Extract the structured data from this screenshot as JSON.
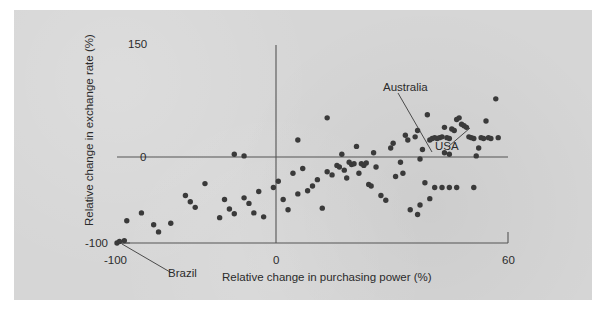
{
  "figure": {
    "background_color": "#d6d6d6",
    "page_color": "#ffffff",
    "point_color": "#3a3a3a",
    "axis_color": "#555555",
    "text_color": "#2b2b2b"
  },
  "axes": {
    "x_title": "Relative change in purchasing power (%)",
    "y_title": "Relative change in exchange rate (%)",
    "x_ticks": [
      "-100",
      "0",
      "60"
    ],
    "y_ticks": [
      "150",
      "0",
      "-100"
    ]
  },
  "annotations": [
    {
      "name": "Australia",
      "label": "Australia"
    },
    {
      "name": "USA",
      "label": "USA"
    },
    {
      "name": "Brazil",
      "label": "Brazil"
    }
  ],
  "chart_data": {
    "type": "scatter",
    "title": "",
    "xlabel": "Relative change in purchasing power (%)",
    "ylabel": "Relative change in exchange rate (%)",
    "xlim": [
      -100,
      60
    ],
    "ylim": [
      -100,
      150
    ],
    "xticks": [
      -100,
      0,
      60
    ],
    "yticks": [
      -100,
      0,
      150
    ],
    "grid": false,
    "legend": null,
    "zero_lines": {
      "x": 0,
      "y": 0
    },
    "annotations": [
      {
        "label": "Australia",
        "text_x": -8,
        "text_y": 100,
        "point_x": 16,
        "point_y": 2
      },
      {
        "label": "USA",
        "text_x": 26,
        "text_y": 14,
        "point_x": 35,
        "point_y": 33
      },
      {
        "label": "Brazil",
        "text_x": -80,
        "text_y": -135,
        "point_x": -100,
        "point_y": -100
      }
    ],
    "series": [
      {
        "name": "countries",
        "points": [
          [
            -100,
            -100
          ],
          [
            -99,
            -98
          ],
          [
            -97,
            -97
          ],
          [
            -96,
            -72
          ],
          [
            -90,
            -62
          ],
          [
            -85,
            -77
          ],
          [
            -83,
            -86
          ],
          [
            -78,
            -75
          ],
          [
            -72,
            -40
          ],
          [
            -70,
            -48
          ],
          [
            -68,
            -55
          ],
          [
            -64,
            -25
          ],
          [
            -58,
            -68
          ],
          [
            -56,
            -45
          ],
          [
            -54,
            -57
          ],
          [
            -52,
            -63
          ],
          [
            -48,
            -43
          ],
          [
            -46,
            -50
          ],
          [
            -44,
            -62
          ],
          [
            -42,
            -35
          ],
          [
            -40,
            -67
          ],
          [
            -36,
            -30
          ],
          [
            -34,
            -22
          ],
          [
            -32,
            -45
          ],
          [
            -30,
            -58
          ],
          [
            -28,
            -12
          ],
          [
            -26,
            -38
          ],
          [
            -24,
            -6
          ],
          [
            -22,
            -34
          ],
          [
            -20,
            -28
          ],
          [
            -18,
            -20
          ],
          [
            -16,
            -56
          ],
          [
            -14,
            -10
          ],
          [
            -12,
            -14
          ],
          [
            -10,
            -2
          ],
          [
            -9,
            -4
          ],
          [
            -8,
            12
          ],
          [
            -7,
            -8
          ],
          [
            -6,
            -18
          ],
          [
            -5,
            2
          ],
          [
            -4,
            -1
          ],
          [
            -3,
            0
          ],
          [
            -2,
            22
          ],
          [
            -1,
            -12
          ],
          [
            -14,
            58
          ],
          [
            -26,
            30
          ],
          [
            -48,
            10
          ],
          [
            -52,
            12
          ],
          [
            0,
            0
          ],
          [
            1,
            -2
          ],
          [
            2,
            1
          ],
          [
            3,
            -26
          ],
          [
            4,
            -28
          ],
          [
            5,
            14
          ],
          [
            6,
            -4
          ],
          [
            8,
            -40
          ],
          [
            10,
            -46
          ],
          [
            12,
            20
          ],
          [
            13,
            26
          ],
          [
            14,
            -16
          ],
          [
            16,
            2
          ],
          [
            17,
            -12
          ],
          [
            18,
            36
          ],
          [
            19,
            30
          ],
          [
            20,
            -58
          ],
          [
            22,
            34
          ],
          [
            23,
            42
          ],
          [
            24,
            6
          ],
          [
            25,
            18
          ],
          [
            26,
            -24
          ],
          [
            27,
            62
          ],
          [
            28,
            30
          ],
          [
            29,
            32
          ],
          [
            30,
            33
          ],
          [
            31,
            32
          ],
          [
            32,
            33
          ],
          [
            33,
            34
          ],
          [
            34,
            46
          ],
          [
            35,
            33
          ],
          [
            36,
            32
          ],
          [
            37,
            44
          ],
          [
            38,
            42
          ],
          [
            39,
            56
          ],
          [
            40,
            58
          ],
          [
            41,
            50
          ],
          [
            42,
            48
          ],
          [
            43,
            46
          ],
          [
            44,
            34
          ],
          [
            45,
            33
          ],
          [
            46,
            32
          ],
          [
            47,
            10
          ],
          [
            48,
            20
          ],
          [
            49,
            33
          ],
          [
            50,
            32
          ],
          [
            51,
            54
          ],
          [
            52,
            33
          ],
          [
            53,
            32
          ],
          [
            55,
            82
          ],
          [
            56,
            33
          ],
          [
            30,
            -30
          ],
          [
            33,
            -30
          ],
          [
            36,
            -30
          ],
          [
            39,
            -30
          ],
          [
            46,
            -30
          ],
          [
            28,
            -44
          ],
          [
            24,
            -52
          ],
          [
            23,
            -64
          ],
          [
            34,
            14
          ],
          [
            36,
            12
          ]
        ]
      }
    ]
  }
}
